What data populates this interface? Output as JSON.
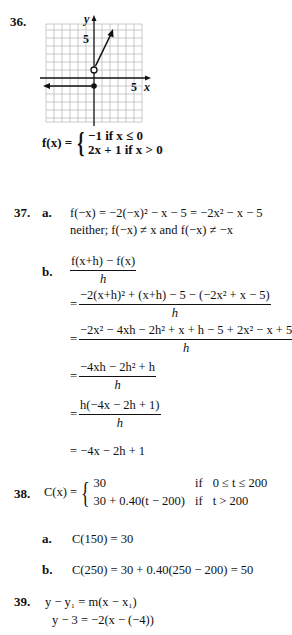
{
  "problems": {
    "p36": {
      "number": "36.",
      "graph": {
        "x_label": "x",
        "y_label": "y",
        "x_tick_label": "5",
        "y_tick_label": "5",
        "grid_color": "#bdbdbd",
        "axis_color": "#111111"
      },
      "func_name": "f(x) =",
      "case1": "−1 if x ≤ 0",
      "case2": "2x + 1 if x > 0"
    },
    "p37": {
      "number": "37.",
      "a": {
        "label": "a.",
        "line1": "f(−x) = −2(−x)² − x − 5 = −2x² − x − 5",
        "line2": "neither;  f(−x) ≠ x  and  f(−x) ≠ −x"
      },
      "b": {
        "label": "b.",
        "step0_num": "f(x+h) − f(x)",
        "step0_den": "h",
        "step1_num": "−2(x+h)² + (x+h) − 5 − (−2x² + x − 5)",
        "step1_den": "h",
        "step2_num": "−2x² − 4xh − 2h² + x + h − 5 + 2x² − x + 5",
        "step2_den": "h",
        "step3_num": "−4xh − 2h² + h",
        "step3_den": "h",
        "step4_num": "h(−4x − 2h + 1)",
        "step4_den": "h",
        "step5": "= −4x − 2h + 1",
        "eq_sign": "="
      }
    },
    "p38": {
      "number": "38.",
      "func_name": "C(x) =",
      "case1_expr": "30",
      "case1_if": "if",
      "case1_cond": "0 ≤ t ≤ 200",
      "case2_expr": "30 + 0.40(t − 200)",
      "case2_if": "if",
      "case2_cond": "t > 200",
      "a": {
        "label": "a.",
        "text": "C(150) = 30"
      },
      "b": {
        "label": "b.",
        "text": "C(250) = 30 + 0.40(250 − 200) = 50"
      }
    },
    "p39": {
      "number": "39.",
      "line1": "y − y₁ = m(x − x₁)",
      "line2": "y − 3 = −2(x − (−4))"
    }
  }
}
